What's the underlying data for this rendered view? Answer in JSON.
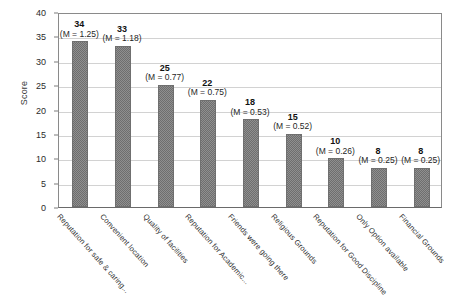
{
  "chart_data": {
    "type": "bar",
    "title": "",
    "xlabel": "",
    "ylabel": "Score",
    "ylim": [
      0,
      40
    ],
    "ytick_step": 5,
    "grid": true,
    "legend": "none",
    "categories": [
      "Reputation for safe & caring...",
      "Convenient location",
      "Quality of facilities",
      "Reputation for Academic...",
      "Friends were going there",
      "Religious Grounds",
      "Reputation for Good Discipline",
      "Only Option available",
      "Financial Grounds"
    ],
    "values": [
      34,
      33,
      25,
      22,
      18,
      15,
      10,
      8,
      8
    ],
    "value_labels": [
      "34",
      "33",
      "25",
      "22",
      "18",
      "15",
      "10",
      "8",
      "8"
    ],
    "mean_labels": [
      "(M = 1.25)",
      "(M = 1.18)",
      "(M = 0.77)",
      "(M = 0.75)",
      "(M = 0.53)",
      "(M = 0.52)",
      "(M = 0.26)",
      "(M = 0.25)",
      "(M = 0.25)"
    ],
    "ytick_labels": [
      "40",
      "35",
      "30",
      "25",
      "20",
      "15",
      "10",
      "5",
      "0"
    ],
    "ytick_values": [
      40,
      35,
      30,
      25,
      20,
      15,
      10,
      5,
      0
    ],
    "bar_color": "#8f8f8f",
    "bar_border_color": "#6f6f6f",
    "grid_color": "#d2d2d2",
    "axis_color": "#8a8a8a",
    "background_color": "#ffffff"
  }
}
